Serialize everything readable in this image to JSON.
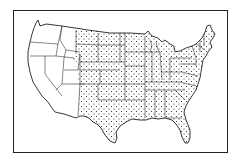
{
  "map": {
    "type": "outline map",
    "region": "Contiguous United States",
    "style": "black-and-white line drawing with state boundaries",
    "colors": {
      "line": "#222222",
      "background": "#ffffff",
      "stipple": "#222222"
    },
    "legend": null,
    "stippled_region": "Central and eastern states (from eastern Montana, Wyoming, Colorado and New Mexico eastward)",
    "unstippled_region": "Western states (Washington, Oregon, California, Nevada, Idaho, Utah, Arizona and western Montana/Wyoming/Colorado/New Mexico)"
  }
}
